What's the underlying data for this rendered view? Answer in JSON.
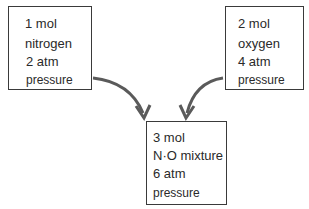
{
  "boxes": {
    "left": {
      "lines": [
        "1 mol",
        "nitrogen",
        "2 atm",
        "pressure"
      ],
      "amount": "1 mol",
      "gas": "nitrogen",
      "pressure": "2 atm"
    },
    "right": {
      "lines": [
        "2 mol",
        "oxygen",
        "4 atm",
        "pressure"
      ],
      "amount": "2 mol",
      "gas": "oxygen",
      "pressure": "4 atm"
    },
    "bottom": {
      "lines": [
        "3 mol",
        "N·O mixture",
        "6 atm",
        "pressure"
      ],
      "amount": "3 mol",
      "gas": "N·O mixture",
      "pressure": "6 atm"
    }
  },
  "arrows": [
    {
      "from": "left",
      "to": "bottom"
    },
    {
      "from": "right",
      "to": "bottom"
    }
  ],
  "colors": {
    "stroke": "#3a3a3a",
    "arrow": "#5a5a5a",
    "text": "#2a2a2a"
  }
}
